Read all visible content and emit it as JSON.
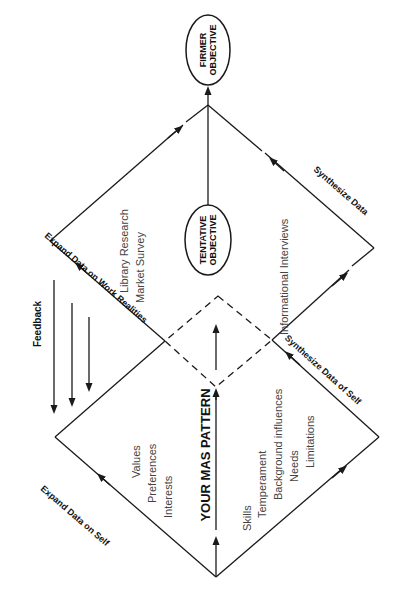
{
  "diagram": {
    "nodes": {
      "firmer_objective": [
        "FIRMER",
        "OBJECTIVE"
      ],
      "tentative_objective": [
        "TENTATIVE",
        "OBJECTIVE"
      ],
      "mas_pattern": "YOUR MAS PATTERN"
    },
    "edge_labels": {
      "expand_self": "Expand Data on Self",
      "expand_work": "Expand Data on Work Realities",
      "synthesize_self": "Synthesize Data of Self",
      "synthesize_data": "Synthesize Data",
      "feedback": "Feedback"
    },
    "lists": {
      "self_left": [
        "Values",
        "Preferences",
        "Interests"
      ],
      "self_right": [
        "Skills",
        "Temperament",
        "Background influences",
        "Needs",
        "Limitations"
      ],
      "work_left": [
        "Library Research",
        "Market Survey"
      ],
      "work_right": [
        "Informational Interviews"
      ]
    },
    "colors": {
      "line": "#1a1a1a",
      "text": "#111111",
      "list_text": "#444444"
    }
  }
}
